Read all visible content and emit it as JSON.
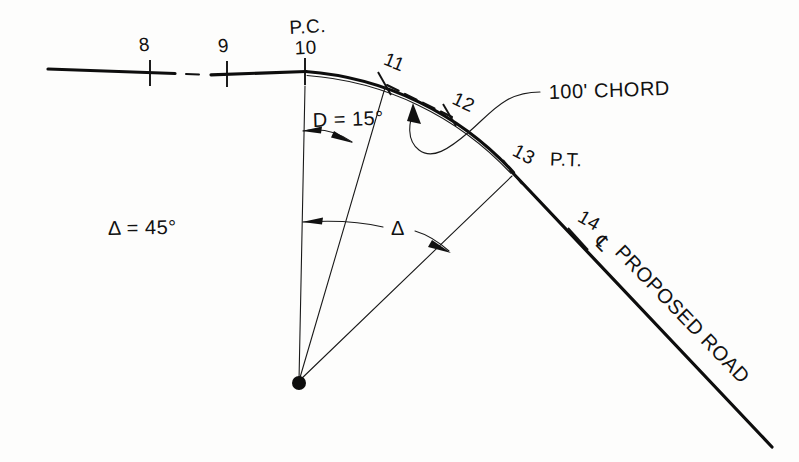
{
  "drawing": {
    "title": "Horizontal circular curve stationing diagram",
    "background_color": "#fdfdfc",
    "ink_color": "#111111",
    "labels": {
      "station_8": "8",
      "station_9": "9",
      "station_10": "10",
      "station_11": "11",
      "station_12": "12",
      "station_13": "13",
      "station_14": "14",
      "pc_marker": "P.C.",
      "pt_marker": "P.T.",
      "degree_of_curve": "D = 15°",
      "delta_value": "Δ = 45°",
      "delta_symbol": "Δ",
      "chord_callout": "100' CHORD",
      "centerline_symbol": "℄",
      "road_label": "PROPOSED ROAD"
    },
    "geometry": {
      "curve_center_x": 299,
      "curve_center_y": 383,
      "pc_x": 305,
      "pc_y": 71,
      "pt_x": 513,
      "pt_y": 172,
      "delta_degrees": 45,
      "degree_of_curve_degrees": 15,
      "chord_length_feet": 100,
      "stations": [
        8,
        9,
        10,
        11,
        12,
        13,
        14
      ]
    }
  }
}
